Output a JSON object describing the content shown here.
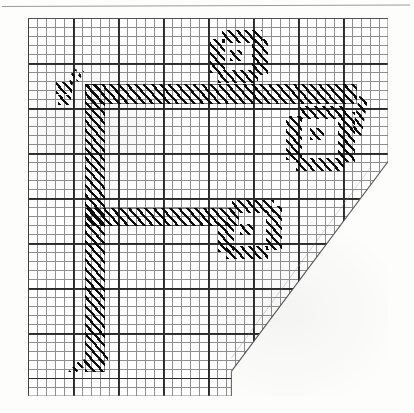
{
  "document": {
    "kind": "scanned-figure",
    "medium": "graph paper",
    "title": "Hatched F-shaped figure on grid paper",
    "background_color": "#ffffff",
    "ink_color": "#0b0b0b",
    "grid_minor_color": "#4a4a4a",
    "grid_major_color": "#202020"
  },
  "paper": {
    "left": 28,
    "top": 18,
    "width": 360,
    "height": 378,
    "corner_cut": "bottom-right diagonal",
    "notch_note": "stepped lower edge at about 57% of sheet width"
  },
  "grid": {
    "minor_cell_px": 9,
    "major_every_cells": 5,
    "major_cell_px": 45,
    "columns": 40,
    "rows": 42
  },
  "figures": [
    {
      "name": "main-f-glyph",
      "description": "large hatched F-shaped stroke: vertical stem with upper and middle horizontal bars",
      "parts": [
        {
          "part": "vertical-stem",
          "x": 57,
          "y": 66,
          "w": 20,
          "h": 288
        },
        {
          "part": "upper-bar",
          "x": 57,
          "y": 66,
          "w": 272,
          "h": 20
        },
        {
          "part": "middle-bar",
          "x": 57,
          "y": 190,
          "w": 154,
          "h": 18
        },
        {
          "part": "foot-flick",
          "x": 40,
          "y": 336,
          "w": 40,
          "h": 18
        }
      ]
    },
    {
      "name": "ring-top-center",
      "description": "small hatched loop above the upper bar",
      "x": 182,
      "y": 12,
      "w": 62,
      "h": 58
    },
    {
      "name": "ring-right",
      "description": "hatched loop to the right, below the upper bar",
      "x": 258,
      "y": 88,
      "w": 82,
      "h": 72
    },
    {
      "name": "ring-lower-middle",
      "description": "hatched loop right of the middle bar",
      "x": 190,
      "y": 182,
      "w": 72,
      "h": 66
    },
    {
      "name": "accent-upper-left",
      "description": "short hatched tick marks left of the stem top",
      "x": 28,
      "y": 50,
      "w": 30,
      "h": 38
    }
  ],
  "labels": {
    "alt_text": "A hand-drawn, diagonally hatched F-like character on graph paper with three small hatched loops and a cut-off bottom-right corner"
  }
}
